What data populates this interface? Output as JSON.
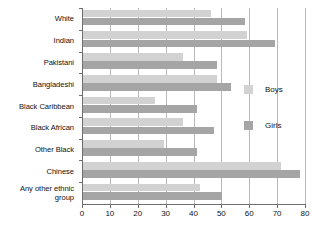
{
  "chart_data": {
    "type": "bar",
    "orientation": "horizontal",
    "title": "",
    "xlabel": "",
    "ylabel": "",
    "xlim": [
      0,
      80
    ],
    "grid": true,
    "legend_position": "right-middle",
    "xticks": [
      "0",
      "10",
      "20",
      "30",
      "40",
      "50",
      "60",
      "70",
      "80"
    ],
    "categories": [
      "White",
      "Indian",
      "Pakistani",
      "Bangladeshi",
      "Black Caribbean",
      "Black African",
      "Other Black",
      "Chinese",
      "Any other ethnic group"
    ],
    "series": [
      {
        "name": "Boys",
        "color": "#d2d2d2",
        "values": [
          46,
          59,
          36,
          48,
          26,
          36,
          29,
          71,
          42
        ]
      },
      {
        "name": "Girls",
        "color": "#a5a5a5",
        "values": [
          58,
          69,
          48,
          53,
          41,
          47,
          41,
          78,
          50
        ]
      }
    ]
  },
  "legend": {
    "items": [
      {
        "label": "Boys",
        "color": "#d2d2d2"
      },
      {
        "label": "Girls",
        "color": "#a5a5a5"
      }
    ]
  }
}
